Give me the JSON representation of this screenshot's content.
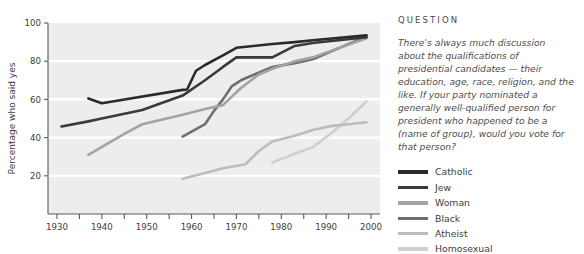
{
  "chart_data": {
    "type": "line",
    "title": "",
    "xlabel": "",
    "ylabel": "Percentage who said yes",
    "xlim": [
      1928,
      2002
    ],
    "ylim": [
      0,
      100
    ],
    "grid": true,
    "x_ticks": [
      1930,
      1940,
      1950,
      1960,
      1970,
      1980,
      1990,
      2000
    ],
    "x_tick_labels": [
      "1930",
      "1940",
      "1950",
      "1960",
      "1970",
      "1980",
      "1990",
      "2000"
    ],
    "x_minor_ticks": [
      1935,
      1945,
      1955,
      1965,
      1975,
      1985,
      1995
    ],
    "y_ticks": [
      20,
      40,
      60,
      80,
      100
    ],
    "y_tick_labels": [
      "20",
      "40",
      "60",
      "80",
      "100"
    ],
    "legend_position": "right",
    "series": [
      {
        "name": "Catholic",
        "color": "#2b2b2b",
        "width": 2.6,
        "points": [
          [
            1937,
            60.5
          ],
          [
            1940,
            58.0
          ],
          [
            1958,
            65.0
          ],
          [
            1959,
            65.2
          ],
          [
            1961,
            75.0
          ],
          [
            1963,
            78.0
          ],
          [
            1967,
            83.0
          ],
          [
            1970,
            87.0
          ],
          [
            1978,
            89.0
          ],
          [
            1983,
            90.0
          ],
          [
            1987,
            91.0
          ],
          [
            1999,
            93.5
          ]
        ]
      },
      {
        "name": "Jew",
        "color": "#3a3a3a",
        "width": 2.6,
        "points": [
          [
            1931,
            45.8
          ],
          [
            1937,
            48.5
          ],
          [
            1940,
            50.0
          ],
          [
            1949,
            54.5
          ],
          [
            1958,
            62.0
          ],
          [
            1963,
            70.0
          ],
          [
            1967,
            77.0
          ],
          [
            1970,
            82.0
          ],
          [
            1978,
            82.0
          ],
          [
            1983,
            88.0
          ],
          [
            1987,
            89.5
          ],
          [
            1999,
            92.5
          ]
        ]
      },
      {
        "name": "Woman",
        "color": "#a3a3a3",
        "width": 2.6,
        "points": [
          [
            1937,
            31.0
          ],
          [
            1945,
            42.0
          ],
          [
            1949,
            47.0
          ],
          [
            1958,
            52.0
          ],
          [
            1963,
            55.0
          ],
          [
            1967,
            57.0
          ],
          [
            1971,
            66.0
          ],
          [
            1975,
            73.0
          ],
          [
            1978,
            76.0
          ],
          [
            1983,
            80.0
          ],
          [
            1987,
            82.0
          ],
          [
            1999,
            92.0
          ]
        ]
      },
      {
        "name": "Black",
        "color": "#6f6f6f",
        "width": 2.6,
        "points": [
          [
            1958,
            40.5
          ],
          [
            1963,
            47.0
          ],
          [
            1965,
            54.0
          ],
          [
            1967,
            60.0
          ],
          [
            1969,
            67.0
          ],
          [
            1971,
            70.0
          ],
          [
            1974,
            73.0
          ],
          [
            1978,
            77.0
          ],
          [
            1983,
            79.0
          ],
          [
            1987,
            81.0
          ],
          [
            1999,
            93.0
          ]
        ]
      },
      {
        "name": "Atheist",
        "color": "#bcbcbc",
        "width": 2.6,
        "points": [
          [
            1958,
            18.5
          ],
          [
            1963,
            21.5
          ],
          [
            1967,
            24.0
          ],
          [
            1972,
            26.0
          ],
          [
            1975,
            33.0
          ],
          [
            1978,
            38.0
          ],
          [
            1983,
            41.0
          ],
          [
            1987,
            44.0
          ],
          [
            1991,
            46.0
          ],
          [
            1995,
            47.0
          ],
          [
            1999,
            48.0
          ]
        ]
      },
      {
        "name": "Homosexual",
        "color": "#cfcfcf",
        "width": 2.6,
        "points": [
          [
            1978,
            27.0
          ],
          [
            1983,
            31.5
          ],
          [
            1987,
            35.0
          ],
          [
            1991,
            42.0
          ],
          [
            1995,
            50.0
          ],
          [
            1999,
            59.0
          ]
        ]
      }
    ]
  },
  "question": {
    "heading": "QUESTION",
    "body": "There's always much discussion about the qualifications of presidential candidates — their education, age, race, religion, and the like. If your party nominated a generally well-qualified person for president who happened to be a (name of group), would you vote for that person?"
  },
  "colors": {
    "plot_background": "#ededed",
    "gridline": "#ffffff",
    "axis": "#5a5a5a",
    "tick_label": "#3c3c3c",
    "page_background": "#ffffff"
  }
}
